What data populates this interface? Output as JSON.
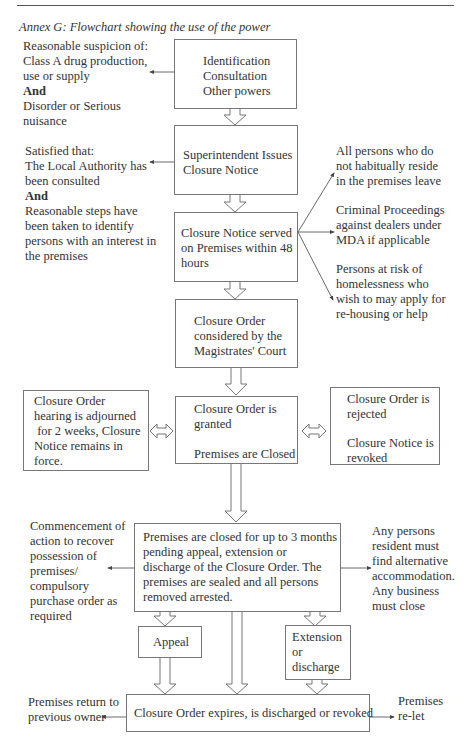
{
  "page": {
    "corner_glyph": "y",
    "caption": "Annex G: Flowchart showing the use of the power"
  },
  "flowchart": {
    "main_boxes": [
      {
        "id": "identification",
        "lines": [
          "Identification",
          "Consultation",
          "Other powers"
        ]
      },
      {
        "id": "superintendent",
        "lines": [
          "Superintendent Issues",
          "Closure Notice"
        ]
      },
      {
        "id": "notice-served",
        "lines": [
          "Closure Notice served",
          "on Premises within 48",
          "hours"
        ]
      },
      {
        "id": "court",
        "lines": [
          "Closure Order",
          "considered by the",
          "Magistrates' Court"
        ]
      },
      {
        "id": "granted",
        "line1": "Closure Order is",
        "line2": "granted",
        "line3": "Premises are Closed"
      },
      {
        "id": "closed",
        "lines": [
          "Premises are closed for up to 3 months",
          "pending appeal, extension or",
          "discharge of the Closure Order. The",
          "premises are sealed and all persons",
          "removed arrested."
        ]
      },
      {
        "id": "appeal",
        "label": "Appeal"
      },
      {
        "id": "extension",
        "lines": [
          "Extension",
          "or",
          "discharge"
        ]
      },
      {
        "id": "expires",
        "label": "Closure Order expires, is discharged or revoked"
      }
    ],
    "side_boxes": {
      "adjourned": {
        "lines": [
          "Closure Order",
          "hearing is adjourned",
          " for 2 weeks, Closure",
          "Notice remains in",
          "force."
        ]
      },
      "rejected": {
        "line1": "Closure Order is",
        "line2": "rejected",
        "line3": "Closure Notice is",
        "line4": "revoked"
      }
    },
    "notes": {
      "suspicion": {
        "lines": [
          "Reasonable suspicion of:",
          "Class A drug production,",
          "use or supply"
        ],
        "connector": "And",
        "lines2": [
          "Disorder or Serious",
          "nuisance"
        ]
      },
      "satisfied": {
        "lines": [
          "Satisfied that:",
          "The Local Authority has",
          "been consulted"
        ],
        "connector": "And",
        "lines2": [
          "Reasonable steps have",
          "been taken to identify",
          "persons with an interest in",
          "the premises"
        ]
      },
      "persons_leave": {
        "lines": [
          "All persons who do",
          "not habitually reside",
          "in the premises leave"
        ]
      },
      "criminal": {
        "lines": [
          "Criminal Proceedings",
          "against dealers under",
          "MDA if applicable"
        ]
      },
      "homelessness": {
        "lines": [
          "Persons at risk of",
          "homelessness who",
          "wish to may apply for",
          "re-housing or help"
        ]
      },
      "recover": {
        "lines": [
          "Commencement of",
          "action to recover",
          "possession of",
          "premises/",
          "compulsory",
          "purchase order as",
          "required"
        ]
      },
      "residents": {
        "lines": [
          "Any persons",
          "resident must",
          "find alternative",
          "accommodation.",
          "Any business",
          "must close"
        ]
      },
      "return_owner": {
        "lines": [
          "Premises return to",
          "previous owner"
        ]
      },
      "relet": {
        "lines": [
          "Premises",
          "re-let"
        ]
      }
    }
  }
}
